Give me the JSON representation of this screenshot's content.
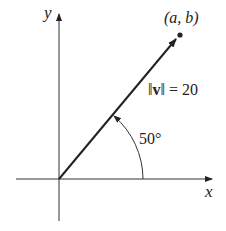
{
  "diagram": {
    "axes": {
      "x_label": "x",
      "y_label": "y"
    },
    "point_label": "(a, b)",
    "magnitude_label": "‖v‖ = 20",
    "magnitude": {
      "prefix": "‖",
      "vector": "v",
      "suffix": "‖ = 20"
    },
    "angle_label": "50°",
    "angle_degrees": 50,
    "vector_magnitude": 20,
    "colors": {
      "ink": "#222222",
      "background": "#ffffff"
    }
  }
}
